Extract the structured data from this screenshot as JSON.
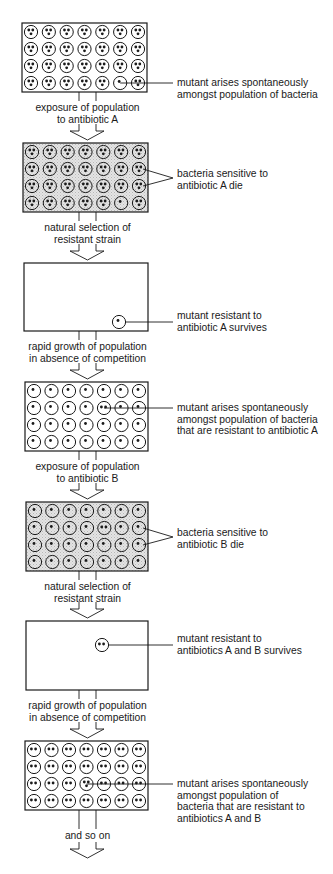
{
  "figure": {
    "colors": {
      "ink": "#1a1a1a",
      "dish_dead": "#dcdcdc",
      "background": "#ffffff"
    },
    "stages": [
      {
        "id": "stage-1",
        "box": {
          "x": 22,
          "y": 23,
          "w": 125,
          "h": 69
        },
        "shaded": false,
        "grid_rows": 4,
        "grid_cols": 7,
        "cell_dots": 0,
        "empty": false,
        "mutant": {
          "row": 3,
          "col": 5,
          "dots": 1
        },
        "callout": {
          "lines": [
            "mutant arises spontaneously",
            "amongst population of bacteria"
          ],
          "x": 177,
          "y": 76,
          "target_row": 3,
          "target_col": 5,
          "fork": false
        }
      },
      {
        "id": "stage-2",
        "box": {
          "x": 23,
          "y": 143,
          "w": 125,
          "h": 69
        },
        "shaded": true,
        "grid_rows": 4,
        "grid_cols": 7,
        "cell_dots": 0,
        "empty": false,
        "mutant": {
          "row": 3,
          "col": 5,
          "dots": 1
        },
        "callout": {
          "lines": [
            "bacteria sensitive to",
            "antibiotic A die"
          ],
          "x": 177,
          "y": 168,
          "fork": true,
          "fork_targets": [
            [
              1,
              6
            ],
            [
              2,
              6
            ]
          ]
        }
      },
      {
        "id": "stage-3",
        "box": {
          "x": 24,
          "y": 263,
          "w": 124,
          "h": 68
        },
        "shaded": false,
        "empty": true,
        "lone": {
          "cx": 119,
          "cy": 322,
          "dots": 1
        },
        "callout": {
          "lines": [
            "mutant resistant to",
            "antibiotic A survives"
          ],
          "x": 177,
          "y": 309
        }
      },
      {
        "id": "stage-4",
        "box": {
          "x": 25,
          "y": 382,
          "w": 123,
          "h": 69
        },
        "shaded": false,
        "grid_rows": 4,
        "grid_cols": 7,
        "cell_dots": 1,
        "empty": false,
        "mutant": {
          "row": 1,
          "col": 4,
          "dots": 2
        },
        "callout": {
          "lines": [
            "mutant arises spontaneously",
            "amongst population of bacteria",
            "that are resistant to antibiotic A"
          ],
          "x": 177,
          "y": 401,
          "target_row": 1,
          "target_col": 4,
          "fork": false
        }
      },
      {
        "id": "stage-5",
        "box": {
          "x": 26,
          "y": 502,
          "w": 122,
          "h": 69
        },
        "shaded": true,
        "grid_rows": 4,
        "grid_cols": 7,
        "cell_dots": 1,
        "empty": false,
        "mutant": {
          "row": 1,
          "col": 4,
          "dots": 2
        },
        "callout": {
          "lines": [
            "bacteria sensitive to",
            "antibiotic B die"
          ],
          "x": 177,
          "y": 527,
          "fork": true,
          "fork_targets": [
            [
              1,
              6
            ],
            [
              2,
              6
            ]
          ]
        }
      },
      {
        "id": "stage-6",
        "box": {
          "x": 26,
          "y": 621,
          "w": 122,
          "h": 69
        },
        "shaded": false,
        "empty": true,
        "lone": {
          "cx": 102,
          "cy": 645,
          "dots": 2
        },
        "callout": {
          "lines": [
            "mutant resistant to",
            "antibiotics A and B survives"
          ],
          "x": 177,
          "y": 639
        }
      },
      {
        "id": "stage-7",
        "box": {
          "x": 25,
          "y": 741,
          "w": 123,
          "h": 69
        },
        "shaded": false,
        "grid_rows": 4,
        "grid_cols": 7,
        "cell_dots": 2,
        "empty": false,
        "mutant": {
          "row": 2,
          "col": 3,
          "dots": 3
        },
        "callout": {
          "lines": [
            "mutant arises spontaneously",
            "amongst population of",
            "bacteria that are resistant to",
            "antibiotics A and B"
          ],
          "x": 177,
          "y": 768,
          "target_row": 2,
          "target_col": 3,
          "fork": false
        }
      }
    ],
    "transitions": [
      {
        "lines": [
          "exposure of population",
          "to antibiotic A"
        ],
        "text_y": 102,
        "arrow_y": 134
      },
      {
        "lines": [
          "natural selection of",
          "resistant strain"
        ],
        "text_y": 222,
        "arrow_y": 254
      },
      {
        "lines": [
          "rapid growth of population",
          "in absence of competition"
        ],
        "text_y": 341,
        "arrow_y": 373
      },
      {
        "lines": [
          "exposure of population",
          "to antibiotic B"
        ],
        "text_y": 461,
        "arrow_y": 493
      },
      {
        "lines": [
          "natural selection of",
          "resistant strain"
        ],
        "text_y": 581,
        "arrow_y": 612
      },
      {
        "lines": [
          "rapid growth of population",
          "in absence of competition"
        ],
        "text_y": 700,
        "arrow_y": 732
      },
      {
        "lines": [
          "and so on"
        ],
        "text_y": 830,
        "arrow_y": 852
      }
    ]
  }
}
